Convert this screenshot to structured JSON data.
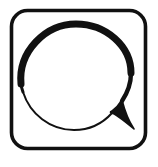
{
  "image": {
    "kind": "line-art-icon",
    "subject": "speech-bubble",
    "title": "Speech bubble in rounded square frame",
    "width": 158,
    "height": 167,
    "background_color": "#ffffff",
    "ink_color": "#111111",
    "style": "hand-drawn brush outline, variable stroke weight, no fill"
  },
  "frame": {
    "name": "rounded-square-border",
    "shape": "rounded-rectangle",
    "stroke_color": "#111111",
    "fill_color": "#ffffff",
    "x": 10,
    "y": 9,
    "width": 137,
    "height": 141,
    "corner_radius": 16,
    "stroke_width": 4
  },
  "bubble": {
    "name": "speech-bubble",
    "shape": "oval-with-tail",
    "stroke_color": "#111111",
    "fill_color": "#ffffff",
    "bounds": {
      "x": 19,
      "y": 22,
      "width": 113,
      "height": 110
    },
    "center": {
      "cx": 75,
      "cy": 76
    },
    "radius": {
      "rx": 56,
      "ry": 54
    },
    "stroke_width_top": 7,
    "stroke_width_left": 5,
    "stroke_width_bottom": 2,
    "stroke_width_right": 4
  },
  "tail": {
    "name": "speech-bubble-tail",
    "direction": "bottom-right",
    "tip": {
      "x": 135,
      "y": 130
    },
    "base_upper": {
      "x": 124,
      "y": 96
    },
    "base_lower": {
      "x": 112,
      "y": 115
    },
    "stroke_color": "#111111"
  },
  "accessibility": {
    "alt_text": "Black outline drawing of a speech balloon inside a rounded square border",
    "role": "img"
  }
}
